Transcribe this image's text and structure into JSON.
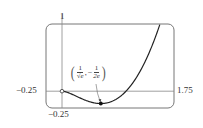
{
  "chart_data": {
    "type": "line",
    "title": "",
    "function": "x^2 ln x",
    "xlabel": "",
    "ylabel": "",
    "xlim": [
      -0.25,
      1.75
    ],
    "ylim": [
      -0.25,
      1
    ],
    "grid": false,
    "tick_labels": {
      "x_left": "−0.25",
      "x_right": "1.75",
      "y_top": "1",
      "y_bottom": "−0.25"
    },
    "series": [
      {
        "name": "f(x) = x^2 ln x",
        "x": [
          0,
          0.1,
          0.2,
          0.3,
          0.4,
          0.5,
          0.6065,
          0.7,
          0.8,
          0.9,
          1.0,
          1.1,
          1.2,
          1.3,
          1.4,
          1.5,
          1.57
        ],
        "y": [
          0,
          -0.023,
          -0.064,
          -0.108,
          -0.147,
          -0.173,
          -0.184,
          -0.175,
          -0.143,
          -0.085,
          0,
          0.115,
          0.263,
          0.443,
          0.659,
          0.912,
          1.0
        ]
      }
    ],
    "annotations": [
      {
        "type": "open-point",
        "x": 0,
        "y": 0
      },
      {
        "type": "minimum-point",
        "x": 0.6065,
        "y": -0.1839,
        "label": "(1/√e, −1/(2e))"
      }
    ]
  },
  "labels": {
    "y_top": "1",
    "x_left": "−0.25",
    "x_right": "1.75",
    "y_bottom": "−0.25",
    "annot_num1": "1",
    "annot_den1": "√e",
    "annot_num2": "1",
    "annot_den2": "2e",
    "annot_open": "(",
    "annot_close": ")",
    "annot_sep": ",",
    "annot_minus": "−"
  },
  "colors": {
    "frame": "#777777",
    "axis": "#888888",
    "curve": "#222222"
  }
}
